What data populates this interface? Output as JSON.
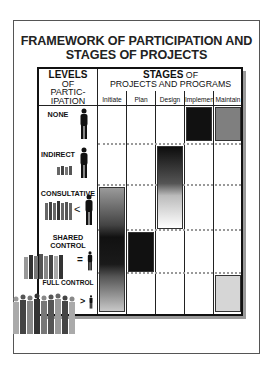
{
  "title_line1": "FRAMEWORK OF PARTICIPATION AND",
  "title_line2": "STAGES OF PROJECTS",
  "levels_header": {
    "big": "LEVELS",
    "line2": "OF",
    "line3": "PARTIC-",
    "line4": "IPATION"
  },
  "stages_header": {
    "big": "STAGES",
    "suffix": " OF",
    "line2": "PROJECTS AND PROGRAMS"
  },
  "stages": [
    "Initiate",
    "Plan",
    "Design",
    "Implement",
    "Maintain"
  ],
  "levels": [
    {
      "label": "NONE",
      "icon": "single-person-icon"
    },
    {
      "label": "INDIRECT",
      "icon": "person-with-small-group-icon"
    },
    {
      "label": "CONSULTATIVE",
      "symbol": "<",
      "icon": "group-less-than-person-icon"
    },
    {
      "label_line1": "SHARED",
      "label_line2": "CONTROL",
      "symbol": "=",
      "icon": "group-equals-person-icon"
    },
    {
      "label": "FULL CONTROL",
      "symbol": ">",
      "icon": "crowd-greater-than-person-icon"
    }
  ],
  "colors": {
    "black": "#111111",
    "dark_gray": "#7f7f7f",
    "light_gray": "#d6d6d6",
    "frame": "#555555",
    "shadow": "#9a9a9a"
  },
  "cells": [
    {
      "level": "NONE",
      "stage": "Implement",
      "fill": "black"
    },
    {
      "level": "NONE",
      "stage": "Maintain",
      "fill": "gray"
    },
    {
      "level": "INDIRECT-CONSULTATIVE",
      "stage": "Design",
      "fill": "gradient black to white"
    },
    {
      "level": "CONSULTATIVE-FULL CONTROL",
      "stage": "Initiate",
      "fill": "gradient gray-black-gray"
    },
    {
      "level": "SHARED CONTROL",
      "stage": "Plan",
      "fill": "black"
    },
    {
      "level": "FULL CONTROL",
      "stage": "Maintain",
      "fill": "light gray"
    }
  ]
}
